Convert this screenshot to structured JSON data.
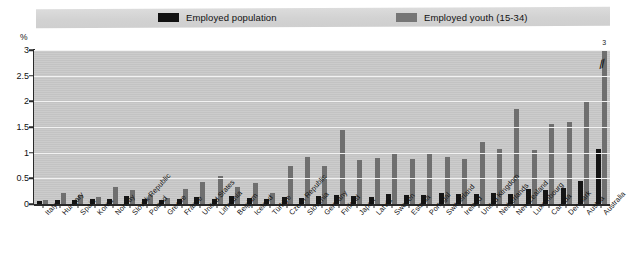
{
  "legend": {
    "series": [
      {
        "label": "Employed population",
        "color": "#151515",
        "swatch": "black"
      },
      {
        "label": "Employed youth (15-34)",
        "color": "#6f6f6f",
        "swatch": "gray"
      }
    ]
  },
  "axis": {
    "unit_label": "%",
    "y_ticks": [
      "0",
      "0.5",
      "1",
      "1.5",
      "2",
      "2.5",
      "3"
    ],
    "y_min": 0,
    "y_max": 3
  },
  "annotations": {
    "australia_footnote": "3",
    "australia_truncated": true
  },
  "chart_data": {
    "type": "bar",
    "title": "",
    "xlabel": "",
    "ylabel": "%",
    "ylim": [
      0,
      3
    ],
    "ytick_values": [
      0,
      0.5,
      1,
      1.5,
      2,
      2.5,
      3
    ],
    "grid": true,
    "legend_position": "top",
    "categories": [
      "Italy",
      "Hungary",
      "Spain",
      "Korea",
      "Norway",
      "Slovak Republic",
      "Poland",
      "Greece",
      "France",
      "United States",
      "Lithuania",
      "Belgium",
      "Iceland",
      "Türkiye",
      "Czech Republic",
      "Slovenia",
      "Germany",
      "Finland",
      "Japan",
      "Latvia",
      "Sweden",
      "Estonia",
      "Portugal",
      "Switzerland",
      "Ireland",
      "United Kingdom",
      "Netherlands",
      "New Zealand",
      "Luxembourg",
      "Canada",
      "Denmark",
      "Austria",
      "Australia"
    ],
    "series": [
      {
        "name": "Employed population",
        "color": "#151515",
        "values": [
          0.05,
          0.07,
          0.08,
          0.09,
          0.1,
          0.16,
          0.09,
          0.07,
          0.09,
          0.13,
          0.1,
          0.15,
          0.12,
          0.09,
          0.13,
          0.11,
          0.15,
          0.18,
          0.16,
          0.14,
          0.2,
          0.18,
          0.18,
          0.22,
          0.19,
          0.2,
          0.22,
          0.2,
          0.3,
          0.28,
          0.32,
          0.44,
          1.08
        ]
      },
      {
        "name": "Employed youth (15-34)",
        "color": "#6f6f6f",
        "values": [
          0.08,
          0.22,
          0.17,
          0.13,
          0.33,
          0.28,
          0.17,
          0.12,
          0.3,
          0.42,
          0.55,
          0.34,
          0.4,
          0.22,
          0.75,
          0.92,
          0.74,
          1.45,
          0.85,
          0.9,
          1.0,
          0.88,
          1.0,
          0.92,
          0.88,
          1.2,
          1.08,
          1.85,
          1.05,
          1.55,
          1.6,
          1.98,
          3.0
        ]
      }
    ]
  }
}
